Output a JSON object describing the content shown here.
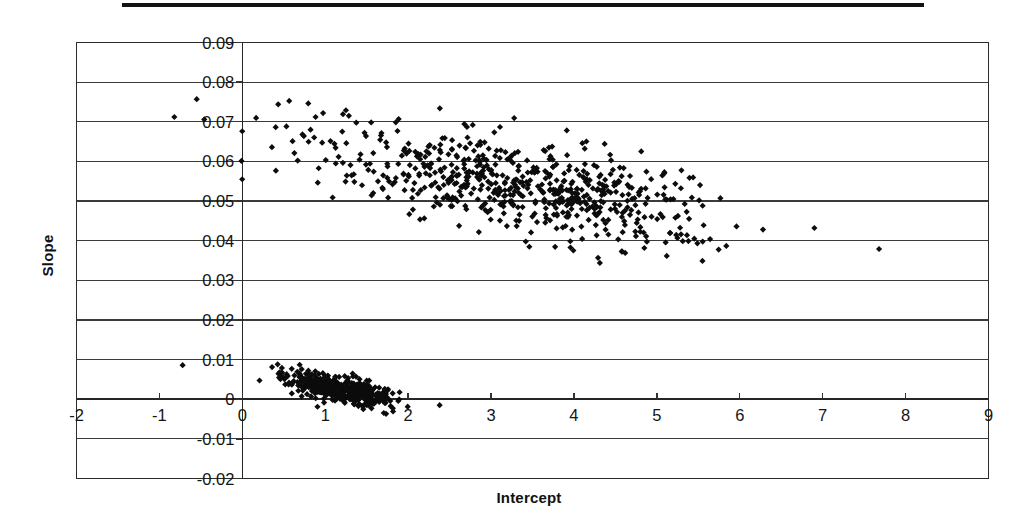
{
  "figure": {
    "has_top_rule": true,
    "background_color": "#ffffff",
    "ink_color": "#0c0c0c"
  },
  "chart_data": {
    "type": "scatter",
    "title": "",
    "xlabel": "Intercept",
    "ylabel": "Slope",
    "xlim": [
      -2,
      9
    ],
    "ylim": [
      -0.02,
      0.09
    ],
    "xticks": [
      -2,
      -1,
      0,
      1,
      2,
      3,
      4,
      5,
      6,
      7,
      8,
      9
    ],
    "xticklabels": [
      "-2",
      "-1",
      "0",
      "1",
      "2",
      "3",
      "4",
      "5",
      "6",
      "7",
      "8",
      "9"
    ],
    "yticks": [
      -0.02,
      -0.01,
      0,
      0.01,
      0.02,
      0.03,
      0.04,
      0.05,
      0.06,
      0.07,
      0.08,
      0.09
    ],
    "yticklabels": [
      "-0.02",
      "-0.01",
      "0",
      "0.01",
      "0.02",
      "0.03",
      "0.04",
      "0.05",
      "0.06",
      "0.07",
      "0.08",
      "0.09"
    ],
    "grid": "horizontal",
    "legend": "none",
    "marker": "diamond",
    "marker_color": "#0c0c0c",
    "marker_size": 5,
    "clusters": [
      {
        "name": "upper-cluster",
        "n_points": 640,
        "x_range": [
          -0.85,
          7.7
        ],
        "y_range": [
          0.034,
          0.078
        ],
        "description": "Broad negatively-sloping band of points; slope falls from about 0.068 near intercept 0 to about 0.042 near intercept 6, densest between intercept 2.5 and 5.5 at slope 0.048-0.062",
        "trend_endpoints": [
          [
            0.0,
            0.0665
          ],
          [
            7.0,
            0.0405
          ]
        ],
        "y_scatter": 0.006
      },
      {
        "name": "lower-cluster",
        "n_points": 430,
        "x_range": [
          -0.75,
          2.45
        ],
        "y_range": [
          -0.006,
          0.0095
        ],
        "description": "Tight negatively-sloping band near zero slope; runs from about (0.05, 0.008) down to (2.1, -0.003)",
        "trend_endpoints": [
          [
            0.05,
            0.0078
          ],
          [
            2.15,
            -0.0022
          ]
        ],
        "y_scatter": 0.0016
      }
    ],
    "outliers": [
      {
        "x": -0.82,
        "y": 0.0712
      },
      {
        "x": -0.55,
        "y": 0.0757
      },
      {
        "x": -0.72,
        "y": 0.0086
      },
      {
        "x": 6.28,
        "y": 0.0428
      },
      {
        "x": 6.9,
        "y": 0.0432
      },
      {
        "x": 7.68,
        "y": 0.0379
      },
      {
        "x": 5.55,
        "y": 0.0349
      },
      {
        "x": 2.38,
        "y": -0.0015
      }
    ]
  }
}
